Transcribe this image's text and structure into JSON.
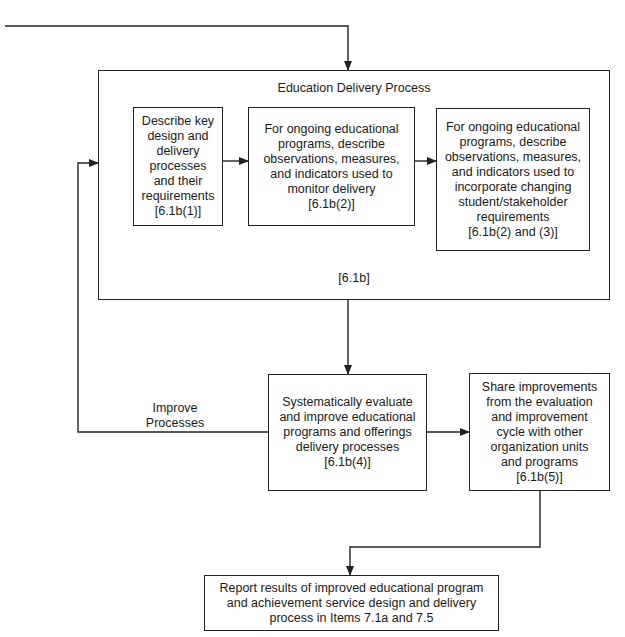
{
  "diagram": {
    "outer_box": {
      "title": "Education Delivery Process",
      "ref": "[6.1b]"
    },
    "inner_boxes": [
      {
        "text": "Describe key\ndesign and\ndelivery\nprocesses\nand their\nrequirements\n[6.1b(1)]"
      },
      {
        "text": "For ongoing educational\nprograms, describe\nobservations, measures,\nand indicators used to\nmonitor delivery\n[6.1b(2)]"
      },
      {
        "text": "For ongoing educational\nprograms, describe\nobservations, measures,\nand indicators used to\nincorporate changing\nstudent/stakeholder\nrequirements\n[6.1b(2) and (3)]"
      }
    ],
    "evaluate_box": {
      "text": "Systematically evaluate\nand improve educational\nprograms and offerings\ndelivery processes\n[6.1b(4)]"
    },
    "share_box": {
      "text": "Share improvements\nfrom the evaluation\nand improvement\ncycle with other\norganization units\nand programs\n[6.1b(5)]"
    },
    "report_box": {
      "text": "Report results of improved educational program\nand achievement service design and delivery\nprocess in Items 7.1a and 7.5"
    },
    "feedback_label": "Improve\nProcesses",
    "colors": {
      "line": "#222222",
      "background": "#ffffff"
    }
  }
}
